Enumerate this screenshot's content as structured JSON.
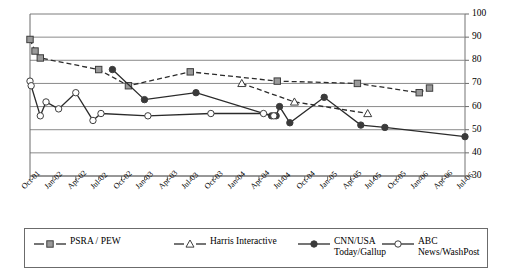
{
  "chart_data": {
    "type": "line",
    "title": "",
    "subtitle": "",
    "xlabel": "",
    "ylabel": "",
    "ylim": [
      30,
      100
    ],
    "ytick_step": 10,
    "yticks": [
      30,
      40,
      50,
      60,
      70,
      80,
      90,
      100
    ],
    "grid": "horizontal",
    "legend_position": "bottom",
    "categories": [
      "Oct-01",
      "Jan-02",
      "Apr-02",
      "Jul-02",
      "Oct-02",
      "Jan-03",
      "Apr-03",
      "Jul-03",
      "Oct-03",
      "Jan-04",
      "Apr-04",
      "Jul-04",
      "Oct-04",
      "Jan-05",
      "Apr-05",
      "Jul-05",
      "Oct-05",
      "Jan-06",
      "Apr-06",
      "Jul-06"
    ],
    "series": [
      {
        "name": "PSRA / PEW",
        "marker": "square",
        "marker_fill": "#9a9a9a",
        "line_style": "dashed",
        "color": "#2b2b2b",
        "points": [
          {
            "x": "Oct-01",
            "xoff": 0.0,
            "y": 89
          },
          {
            "x": "Oct-01",
            "xoff": 0.22,
            "y": 84
          },
          {
            "x": "Oct-01",
            "xoff": 0.45,
            "y": 81
          },
          {
            "x": "Jul-02",
            "xoff": 0.0,
            "y": 76
          },
          {
            "x": "Oct-02",
            "xoff": 0.3,
            "y": 69
          },
          {
            "x": "Jul-03",
            "xoff": 0.0,
            "y": 75
          },
          {
            "x": "Jul-04",
            "xoff": -0.2,
            "y": 71
          },
          {
            "x": "Apr-05",
            "xoff": 0.3,
            "y": 70
          },
          {
            "x": "Jan-06",
            "xoff": 0.0,
            "y": 66
          },
          {
            "x": "Jan-06",
            "xoff": 0.45,
            "y": 68
          }
        ]
      },
      {
        "name": "Harris Interactive",
        "marker": "triangle",
        "marker_fill": "#ffffff",
        "line_style": "dashed",
        "color": "#2b2b2b",
        "points": [
          {
            "x": "Jan-04",
            "xoff": 0.25,
            "y": 70
          },
          {
            "x": "Oct-04",
            "xoff": -0.45,
            "y": 62
          },
          {
            "x": "Jul-05",
            "xoff": -0.25,
            "y": 57
          }
        ]
      },
      {
        "name": "CNN/USA\nToday/Gallup",
        "marker": "circle",
        "marker_fill": "#3a3a3a",
        "line_style": "solid",
        "color": "#2b2b2b",
        "points": [
          {
            "x": "Jul-02",
            "xoff": 0.6,
            "y": 76
          },
          {
            "x": "Jan-03",
            "xoff": 0.0,
            "y": 63
          },
          {
            "x": "Jul-03",
            "xoff": 0.25,
            "y": 66
          },
          {
            "x": "Jul-04",
            "xoff": -0.45,
            "y": 56
          },
          {
            "x": "Jul-04",
            "xoff": -0.25,
            "y": 56
          },
          {
            "x": "Jul-04",
            "xoff": -0.1,
            "y": 60
          },
          {
            "x": "Jul-04",
            "xoff": 0.35,
            "y": 53
          },
          {
            "x": "Jan-05",
            "xoff": -0.15,
            "y": 64
          },
          {
            "x": "Apr-05",
            "xoff": 0.45,
            "y": 52
          },
          {
            "x": "Jul-05",
            "xoff": 0.5,
            "y": 51
          },
          {
            "x": "Jul-06",
            "xoff": 0.0,
            "y": 47
          }
        ]
      },
      {
        "name": "ABC News/WashPost",
        "marker": "circle",
        "marker_fill": "#ffffff",
        "line_style": "solid",
        "color": "#2b2b2b",
        "points": [
          {
            "x": "Oct-01",
            "xoff": 0.0,
            "y": 71
          },
          {
            "x": "Oct-01",
            "xoff": 0.05,
            "y": 69
          },
          {
            "x": "Oct-01",
            "xoff": 0.45,
            "y": 56
          },
          {
            "x": "Oct-01",
            "xoff": 0.7,
            "y": 62
          },
          {
            "x": "Jan-02",
            "xoff": 0.25,
            "y": 59
          },
          {
            "x": "Apr-02",
            "xoff": 0.0,
            "y": 66
          },
          {
            "x": "Apr-02",
            "xoff": 0.75,
            "y": 54
          },
          {
            "x": "Jul-02",
            "xoff": 0.1,
            "y": 57
          },
          {
            "x": "Jan-03",
            "xoff": 0.15,
            "y": 56
          },
          {
            "x": "Oct-03",
            "xoff": -0.1,
            "y": 57
          },
          {
            "x": "Apr-04",
            "xoff": 0.2,
            "y": 57
          },
          {
            "x": "Jul-04",
            "xoff": -0.35,
            "y": 56
          }
        ]
      }
    ]
  },
  "legend": {
    "entries": [
      {
        "label": "PSRA / PEW"
      },
      {
        "label": "Harris Interactive"
      },
      {
        "label": "CNN/USA\nToday/Gallup"
      },
      {
        "label": "ABC News/WashPost"
      }
    ]
  }
}
